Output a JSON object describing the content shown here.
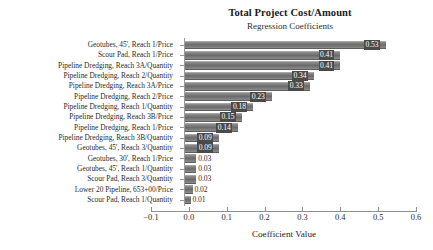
{
  "chart_data": {
    "type": "bar",
    "orientation": "horizontal",
    "title": "Total Project Cost/Amount",
    "subtitle": "Regression Coefficients",
    "xlabel": "Coefficient Value",
    "ylabel": "",
    "xlim": [
      -0.1,
      0.6
    ],
    "xticks": [
      -0.1,
      0.0,
      0.1,
      0.2,
      0.3,
      0.4,
      0.5,
      0.6
    ],
    "xtick_labels": [
      "−0.1",
      "0.0",
      "0.1",
      "0.2",
      "0.3",
      "0.4",
      "0.5",
      "0.6"
    ],
    "grid": false,
    "legend": "none",
    "bar_color": "#7a7a7a",
    "label_box_color": "#4a4a4a",
    "categories": [
      "Geotubes, 45', Reach 1/Price",
      "Scour Pad, Reach 1/Price",
      "Pipeline Dredging, Reach 3A/Quantity",
      "Pipeline Dredging, Reach 2/Quantity",
      "Pipeline Dredging, Reach 3A/Price",
      "Pipeline Dredging, Reach 2/Price",
      "Pipeline Dredging, Reach 1/Quantity",
      "Pipeline Dredging, Reach 3B/Price",
      "Pipeline Dredging, Reach 1/Price",
      "Pipeline Dredging, Reach 3B/Quantity",
      "Geotubes, 45', Reach 3/Quantity",
      "Geotubes, 30', Reach 1/Price",
      "Geotubes, 45', Reach 1/Quantity",
      "Scour Pad, Reach 3/Quantity",
      "Lower 20 Pipeline, 653+00/Price",
      "Scour Pad, Reach 1/Quantity"
    ],
    "values": [
      0.53,
      0.41,
      0.41,
      0.34,
      0.33,
      0.23,
      0.18,
      0.15,
      0.14,
      0.09,
      0.09,
      0.03,
      0.03,
      0.03,
      0.02,
      0.01
    ],
    "value_labels": [
      "0.53",
      "0.41",
      "0.41",
      "0.34",
      "0.33",
      "0.23",
      "0.18",
      "0.15",
      "0.14",
      "0.09",
      "0.09",
      "0.03",
      "0.03",
      "0.03",
      "0.02",
      "0.01"
    ]
  }
}
